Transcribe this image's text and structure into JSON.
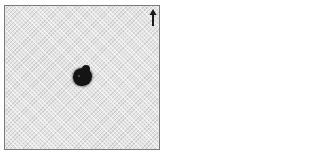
{
  "image": {
    "description": "Dark lesion/specimen on white textured fabric background",
    "orientation_indicator": "up-arrow",
    "colors": {
      "background": "#e4e4e4",
      "specimen": "#141414",
      "border": "#7a7a7a",
      "arrow": "#1a1a1a"
    }
  }
}
